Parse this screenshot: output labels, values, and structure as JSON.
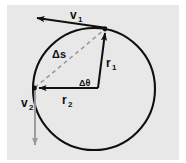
{
  "figure": {
    "background_color": "#ffffff",
    "panel_color": "#e8e8e8",
    "stroke_color": "#101010",
    "accent_gray": "#9a9a9a"
  },
  "labels": {
    "v1": "v",
    "v1_sub": "1",
    "v2": "v",
    "v2_sub": "2",
    "r1": "r",
    "r1_sub": "1",
    "r2": "r",
    "r2_sub": "2",
    "delta_s": "Δs",
    "delta_theta": "Δθ"
  },
  "geometry": {
    "circle": {
      "cx": 94,
      "cy": 89,
      "r": 61,
      "stroke_width": 2
    },
    "center_point": {
      "x": 98,
      "y": 88
    },
    "point_p1": {
      "x": 105,
      "y": 29
    },
    "point_p2": {
      "x": 34,
      "y": 88
    },
    "v1_tip": {
      "x": 32,
      "y": 17
    },
    "v2_tip": {
      "x": 35,
      "y": 150
    },
    "chord_dashed": true
  },
  "icons": {
    "arrowhead": "arrowhead-icon",
    "dashed_chord": "dashed-line-icon"
  }
}
